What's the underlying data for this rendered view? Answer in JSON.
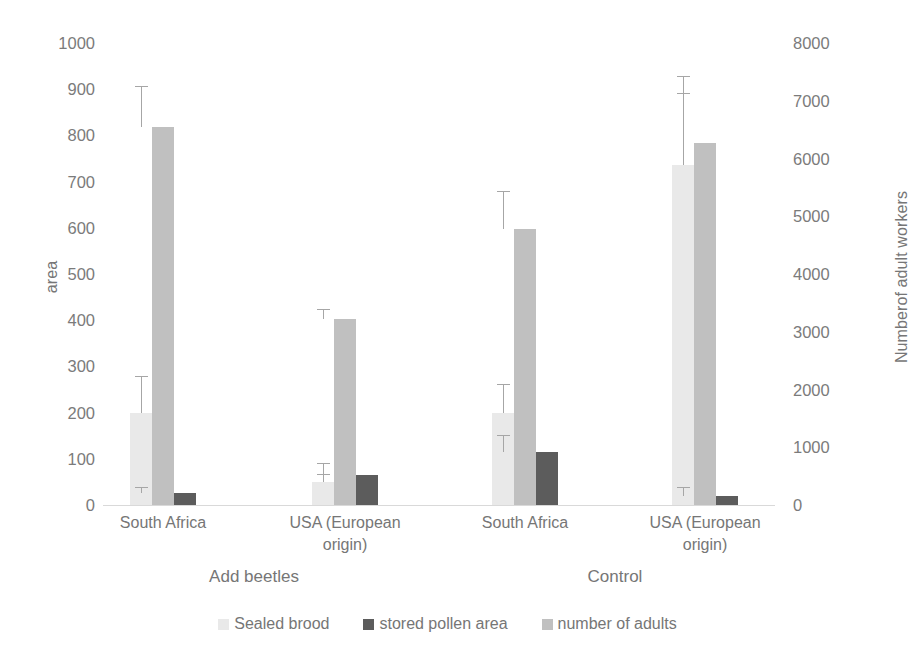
{
  "chart_data": {
    "type": "bar",
    "title": "",
    "subtitle": "",
    "categories": [
      "South Africa",
      "USA (European origin)",
      "South Africa",
      "USA (European origin)"
    ],
    "group_labels": [
      "Add beetles",
      "Control"
    ],
    "xlabel": "",
    "ylabel": "area",
    "y2label": "Numberof adult workers",
    "ylim": [
      0,
      1000
    ],
    "y2lim": [
      0,
      8000
    ],
    "y_ticks": [
      "1000",
      "900",
      "800",
      "700",
      "600",
      "500",
      "400",
      "300",
      "200",
      "100",
      "0"
    ],
    "y_tick_values": [
      1000,
      900,
      800,
      700,
      600,
      500,
      400,
      300,
      200,
      100,
      0
    ],
    "y2_ticks": [
      "8000",
      "7000",
      "6000",
      "5000",
      "4000",
      "3000",
      "2000",
      "1000",
      "0"
    ],
    "y2_tick_values": [
      8000,
      7000,
      6000,
      5000,
      4000,
      3000,
      2000,
      1000,
      0
    ],
    "grid": false,
    "legend_position": "bottom",
    "colors": {
      "sealed_brood": "#e9e9e9",
      "number_of_adults": "#c0c0c0",
      "stored_pollen_area": "#5c5c5c",
      "error_bar": "#a6a6a6",
      "axis_text": "#767676",
      "baseline": "#d9d9d9"
    },
    "series": [
      {
        "name": "Sealed brood",
        "axis": "left",
        "color": "#e9e9e9",
        "draw_order": 0,
        "values": [
          200,
          50,
          200,
          735
        ],
        "error_upper": [
          280,
          68,
          262,
          928
        ]
      },
      {
        "name": "number of adults",
        "axis": "right",
        "color": "#c0c0c0",
        "draw_order": 1,
        "values": [
          818,
          403,
          598,
          784
        ],
        "error_upper": [
          907,
          425,
          680,
          892
        ],
        "values_right_axis": [
          6544,
          3224,
          4784,
          6272
        ],
        "error_upper_right_axis": [
          7256,
          3400,
          5440,
          7136
        ]
      },
      {
        "name": "stored pollen area",
        "axis": "left",
        "color": "#5c5c5c",
        "draw_order": 2,
        "values": [
          25,
          65,
          115,
          20
        ],
        "error_upper": [
          40,
          92,
          152,
          38
        ]
      }
    ]
  },
  "legend": {
    "items": [
      {
        "label": "Sealed brood",
        "color": "#e9e9e9"
      },
      {
        "label": "stored pollen area",
        "color": "#5c5c5c"
      },
      {
        "label": "number of adults",
        "color": "#c0c0c0"
      }
    ]
  }
}
